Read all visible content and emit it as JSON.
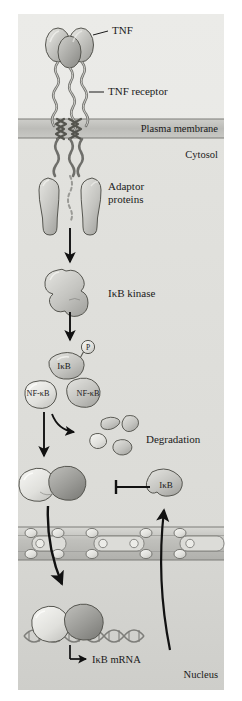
{
  "figure": {
    "background_color": "#ffffff",
    "panel_color": "#e9e9e7"
  },
  "compartments": {
    "extracellular_label": "",
    "membrane_label": "Plasma membrane",
    "cytosol_label": "Cytosol",
    "nucleus_label": "Nucleus"
  },
  "labels": {
    "tnf": "TNF",
    "tnf_receptor": "TNF receptor",
    "adaptor_line1": "Adaptor",
    "adaptor_line2": "proteins",
    "ikb_kinase": "IκB kinase",
    "ikb_top": "IκB",
    "nfkb_left": "NF-κB",
    "nfkb_right": "NF-κB",
    "phosphate": "P",
    "degradation": "Degradation",
    "ikb_protein": "IκB",
    "ikb_mrna": "IκB mRNA"
  },
  "colors": {
    "panel_bg": "#e9e9e7",
    "cytosol_bg": "#dededa",
    "nucleus_bg": "#d2d2ce",
    "membrane_band": "#c2c2be",
    "membrane_line": "#7d7d79",
    "protein_light": "#e4e4e0",
    "protein_mid": "#c3c3bf",
    "protein_dark": "#9e9e9a",
    "outline": "#4a4a46",
    "arrow": "#111111",
    "text": "#1a1a1a",
    "dna": "#8a8a86"
  },
  "elements": {
    "tnf_trimer_lobes": 3,
    "receptor_chains": 3,
    "adaptor_proteins": 2,
    "degradation_fragments": 5,
    "nuclear_pores": 3,
    "nfkb_subunits": 2
  }
}
